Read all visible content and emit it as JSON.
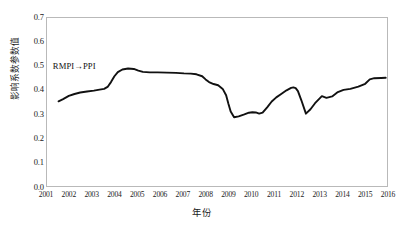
{
  "chart_data": {
    "type": "line",
    "title": "",
    "xlabel": "年份",
    "ylabel": "影响系数参数值",
    "xlim": [
      2001,
      2016
    ],
    "ylim": [
      0.0,
      0.7
    ],
    "grid": false,
    "legend_position": "none",
    "annotations": [
      {
        "text": "RMPI→PPI",
        "x": 2001.3,
        "y": 0.5
      }
    ],
    "xticks": [
      "2001",
      "2002",
      "2003",
      "2004",
      "2005",
      "2006",
      "2007",
      "2008",
      "2009",
      "2010",
      "2011",
      "2012",
      "2013",
      "2014",
      "2015",
      "2016"
    ],
    "yticks": [
      "0.0",
      "0.1",
      "0.2",
      "0.3",
      "0.4",
      "0.5",
      "0.6",
      "0.7"
    ],
    "series": [
      {
        "name": "RMPI→PPI",
        "color": "#111111",
        "x": [
          2001.55,
          2001.75,
          2002.0,
          2002.25,
          2002.5,
          2002.8,
          2003.1,
          2003.35,
          2003.55,
          2003.7,
          2003.85,
          2004.0,
          2004.15,
          2004.35,
          2004.6,
          2004.85,
          2005.05,
          2005.25,
          2005.55,
          2005.9,
          2006.3,
          2006.7,
          2007.05,
          2007.35,
          2007.6,
          2007.85,
          2008.0,
          2008.15,
          2008.35,
          2008.55,
          2008.75,
          2008.9,
          2009.0,
          2009.1,
          2009.25,
          2009.45,
          2009.7,
          2009.9,
          2010.05,
          2010.2,
          2010.35,
          2010.5,
          2010.7,
          2010.9,
          2011.1,
          2011.3,
          2011.55,
          2011.75,
          2011.85,
          2011.95,
          2012.05,
          2012.2,
          2012.4,
          2012.6,
          2012.8,
          2012.95,
          2013.1,
          2013.3,
          2013.55,
          2013.8,
          2014.05,
          2014.35,
          2014.7,
          2015.0,
          2015.2,
          2015.4,
          2015.7,
          2015.9
        ],
        "y": [
          0.353,
          0.362,
          0.375,
          0.383,
          0.389,
          0.393,
          0.397,
          0.401,
          0.404,
          0.412,
          0.432,
          0.456,
          0.473,
          0.484,
          0.488,
          0.486,
          0.479,
          0.474,
          0.472,
          0.472,
          0.471,
          0.47,
          0.468,
          0.467,
          0.464,
          0.456,
          0.443,
          0.432,
          0.424,
          0.419,
          0.404,
          0.378,
          0.343,
          0.311,
          0.287,
          0.291,
          0.299,
          0.306,
          0.308,
          0.307,
          0.302,
          0.306,
          0.328,
          0.352,
          0.369,
          0.382,
          0.398,
          0.408,
          0.41,
          0.407,
          0.395,
          0.357,
          0.302,
          0.32,
          0.345,
          0.36,
          0.374,
          0.367,
          0.373,
          0.391,
          0.4,
          0.404,
          0.413,
          0.425,
          0.443,
          0.448,
          0.449,
          0.45
        ]
      }
    ]
  }
}
